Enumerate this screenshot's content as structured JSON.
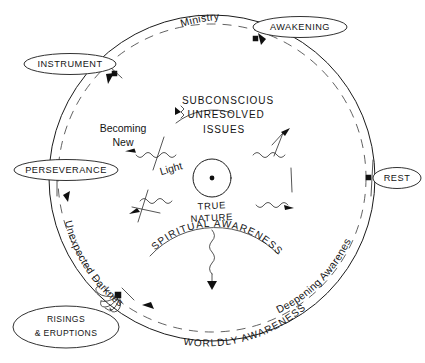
{
  "diagram": {
    "title_present": false,
    "background_color": "#ffffff",
    "ink_color": "#141414",
    "center": {
      "label_line1": "TRUE",
      "label_line2": "NATURE",
      "core_icon": "dot-in-circle-icon"
    },
    "inner_labels": [
      {
        "id": "subconscious",
        "text": "SUBCONSCIOUS"
      },
      {
        "id": "unresolved",
        "text": "UNRESOLVED"
      },
      {
        "id": "issues",
        "text": "ISSUES"
      },
      {
        "id": "becoming-new-line1",
        "text": "Becoming"
      },
      {
        "id": "becoming-new-line2",
        "text": "New"
      },
      {
        "id": "light",
        "text": "Light"
      }
    ],
    "arc_labels": [
      {
        "id": "ministry",
        "text": "Ministry",
        "position": "top",
        "style": "mixed-case"
      },
      {
        "id": "spiritual-awareness",
        "text": "SPIRITUAL AWARENESS",
        "position": "inner-bottom",
        "style": "caps"
      },
      {
        "id": "worldly-awareness",
        "text": "WORLDLY AWARENESS",
        "position": "bottom",
        "style": "caps"
      },
      {
        "id": "deepening-awareness",
        "text": "Deepening Awareness",
        "position": "bottom-right",
        "style": "mixed-case"
      },
      {
        "id": "unexpected-darkness",
        "text": "Unexpected Darkness",
        "position": "bottom-left",
        "style": "mixed-case"
      }
    ],
    "station_labels": [
      {
        "id": "awakening",
        "text": "AWAKENING",
        "position": "top-right",
        "lines": 1
      },
      {
        "id": "instrument",
        "text": "INSTRUMENT",
        "position": "top-left",
        "lines": 1
      },
      {
        "id": "perseverance",
        "text": "PERSEVERANCE",
        "position": "left",
        "lines": 1
      },
      {
        "id": "rest",
        "text": "REST",
        "position": "right",
        "lines": 1
      },
      {
        "id": "risings-eruptions",
        "text_line1": "RISINGS",
        "text_line2": "& ERUPTIONS",
        "position": "bottom-left",
        "lines": 2
      }
    ],
    "node_count": 5,
    "ring": {
      "outer_style": "solid",
      "inner_style": "dashed",
      "direction": "counter-clockwise"
    },
    "radiating_rays": {
      "count": 5,
      "style": "wavy-arrow-outward",
      "description": "squiggly lines radiating from center ending in arrowheads"
    }
  }
}
